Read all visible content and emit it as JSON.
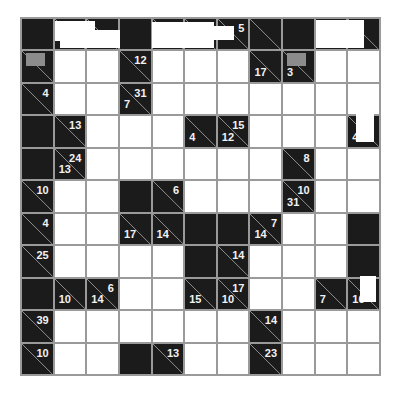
{
  "puzzle": {
    "type": "kakuro",
    "rows": 11,
    "cols": 11,
    "colors": {
      "black": "#1b1b1b",
      "white": "#ffffff",
      "grid": "#9a9a9a",
      "clue_text": "#f2f2f2",
      "marker": "#8c8c8c"
    },
    "grid": [
      [
        "B",
        "C",
        "C",
        "B",
        "C",
        "C",
        "C",
        "C",
        "B",
        "B",
        "C"
      ],
      [
        "C",
        "W",
        "W",
        "C",
        "W",
        "W",
        "W",
        "C",
        "C",
        "W",
        "W"
      ],
      [
        "C",
        "W",
        "W",
        "C",
        "W",
        "W",
        "W",
        "W",
        "W",
        "W",
        "W"
      ],
      [
        "B",
        "C",
        "W",
        "W",
        "W",
        "C",
        "C",
        "W",
        "W",
        "W",
        "C"
      ],
      [
        "B",
        "C",
        "W",
        "W",
        "W",
        "W",
        "W",
        "W",
        "C",
        "W",
        "W"
      ],
      [
        "C",
        "W",
        "W",
        "B",
        "C",
        "W",
        "W",
        "W",
        "C",
        "W",
        "W"
      ],
      [
        "C",
        "W",
        "W",
        "C",
        "C",
        "B",
        "B",
        "C",
        "W",
        "W",
        "B"
      ],
      [
        "C",
        "W",
        "W",
        "W",
        "W",
        "B",
        "C",
        "W",
        "W",
        "W",
        "B"
      ],
      [
        "B",
        "C",
        "C",
        "W",
        "W",
        "C",
        "C",
        "W",
        "W",
        "C",
        "C"
      ],
      [
        "C",
        "W",
        "W",
        "W",
        "W",
        "W",
        "W",
        "C",
        "W",
        "W",
        "W"
      ],
      [
        "C",
        "W",
        "W",
        "B",
        "C",
        "W",
        "W",
        "C",
        "W",
        "W",
        "W"
      ]
    ],
    "clues": {
      "0-6": {
        "right": "5",
        "down": ""
      },
      "1-0": {
        "right": "",
        "down": "",
        "marker": true
      },
      "1-3": {
        "right": "12",
        "down": ""
      },
      "1-7": {
        "right": "",
        "down": "17"
      },
      "1-8": {
        "right": "",
        "down": "3",
        "marker": true
      },
      "2-0": {
        "right": "4",
        "down": ""
      },
      "2-3": {
        "right": "31",
        "down": "7"
      },
      "3-1": {
        "right": "13",
        "down": ""
      },
      "3-5": {
        "right": "",
        "down": "4"
      },
      "3-6": {
        "right": "15",
        "down": "12"
      },
      "3-10": {
        "right": "",
        "down": "4"
      },
      "4-1": {
        "right": "24",
        "down": "13"
      },
      "4-8": {
        "right": "8",
        "down": ""
      },
      "5-0": {
        "right": "10",
        "down": ""
      },
      "5-4": {
        "right": "6",
        "down": ""
      },
      "5-8": {
        "right": "10",
        "down": "31"
      },
      "6-0": {
        "right": "4",
        "down": ""
      },
      "6-3": {
        "right": "",
        "down": "17"
      },
      "6-4": {
        "right": "",
        "down": "14"
      },
      "6-7": {
        "right": "7",
        "down": "14"
      },
      "7-0": {
        "right": "25",
        "down": ""
      },
      "7-6": {
        "right": "14",
        "down": ""
      },
      "8-1": {
        "right": "",
        "down": "10"
      },
      "8-2": {
        "right": "6",
        "down": "14"
      },
      "8-5": {
        "right": "",
        "down": "15"
      },
      "8-6": {
        "right": "17",
        "down": "10"
      },
      "8-9": {
        "right": "",
        "down": "7"
      },
      "8-10": {
        "right": "",
        "down": "16"
      },
      "9-0": {
        "right": "39",
        "down": ""
      },
      "9-7": {
        "right": "14",
        "down": ""
      },
      "10-0": {
        "right": "10",
        "down": ""
      },
      "10-4": {
        "right": "13",
        "down": ""
      },
      "10-7": {
        "right": "23",
        "down": ""
      }
    }
  }
}
